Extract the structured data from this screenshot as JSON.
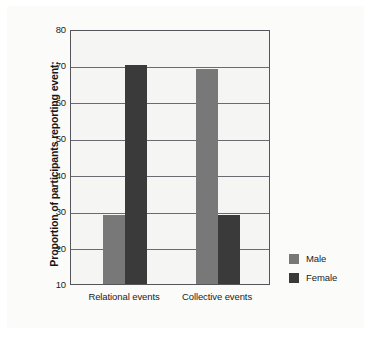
{
  "chart_data": {
    "type": "bar",
    "title": "",
    "xlabel": "",
    "ylabel": "Proportion of participants reporting event:",
    "categories": [
      "Relational events",
      "Collective events"
    ],
    "series": [
      {
        "name": "Male",
        "color": "#787878",
        "values": [
          29,
          69
        ]
      },
      {
        "name": "Female",
        "color": "#3a3a3a",
        "values": [
          70,
          29
        ]
      }
    ],
    "ylim": [
      10,
      80
    ],
    "ytick_labels": [
      "80",
      "70",
      "60",
      "50",
      "40",
      "30",
      "20",
      "10"
    ],
    "ytick_values": [
      80,
      70,
      60,
      50,
      40,
      30,
      20,
      10
    ],
    "grid": "horizontal",
    "legend_position": "right",
    "plot_background": "#f5f5f3",
    "frame_color": "#54545a"
  },
  "legend": {
    "items": [
      {
        "label": "Male"
      },
      {
        "label": "Female"
      }
    ]
  }
}
